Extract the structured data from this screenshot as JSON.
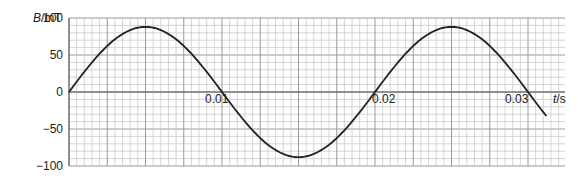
{
  "chart_data": {
    "type": "line",
    "title": "",
    "xlabel": "t/s",
    "ylabel": "B/mT",
    "xlim": [
      0,
      0.0325
    ],
    "ylim": [
      -100,
      100
    ],
    "x_ticks": [
      "0.01",
      "0.02",
      "0.03"
    ],
    "y_ticks": [
      "100",
      "50",
      "0",
      "-50",
      "-100"
    ],
    "grid": true,
    "series": [
      {
        "name": "B",
        "function": "88*sin(2*pi*50*t)",
        "amplitude": 88,
        "frequency_hz": 50,
        "period_s": 0.02,
        "x": [
          0,
          0.0025,
          0.005,
          0.0075,
          0.01,
          0.0125,
          0.015,
          0.0175,
          0.02,
          0.0225,
          0.025,
          0.0275,
          0.03,
          0.0313
        ],
        "values": [
          0,
          62,
          88,
          62,
          0,
          -62,
          -88,
          -62,
          0,
          62,
          88,
          62,
          0,
          -35
        ]
      }
    ]
  },
  "labels": {
    "ylabel_var": "B",
    "ylabel_unit": "/mT",
    "xlabel_var": "t",
    "xlabel_unit": "/s",
    "y100": "100",
    "y50": "50",
    "y0": "0",
    "ym50": "−50",
    "ym100": "−100",
    "x001": "0.01",
    "x002": "0.02",
    "x003": "0.03"
  }
}
